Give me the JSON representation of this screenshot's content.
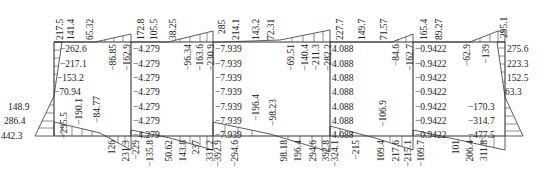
{
  "diagram": {
    "type": "frame_bending_moment",
    "frame": {
      "columns_x": [
        54,
        131,
        213,
        330,
        413,
        505
      ],
      "top_beam_y": 42,
      "bottom_beam_y": 136
    },
    "top_beam_labels": [
      {
        "text": "217.5",
        "x": 60,
        "y": 40,
        "rot": true
      },
      {
        "text": "141.4",
        "x": 71,
        "y": 40,
        "rot": true
      },
      {
        "text": "65.32",
        "x": 90,
        "y": 40,
        "rot": true
      },
      {
        "text": "172.8",
        "x": 141,
        "y": 40,
        "rot": true
      },
      {
        "text": "105.5",
        "x": 154,
        "y": 40,
        "rot": true
      },
      {
        "text": "38.25",
        "x": 173,
        "y": 40,
        "rot": true
      },
      {
        "text": "285",
        "x": 222,
        "y": 34,
        "rot": true
      },
      {
        "text": "214.1",
        "x": 236,
        "y": 40,
        "rot": true
      },
      {
        "text": "143.2",
        "x": 256,
        "y": 40,
        "rot": true
      },
      {
        "text": "72.31",
        "x": 271,
        "y": 40,
        "rot": true
      },
      {
        "text": "227.7",
        "x": 340,
        "y": 40,
        "rot": true
      },
      {
        "text": "149.7",
        "x": 362,
        "y": 40,
        "rot": true
      },
      {
        "text": "71.57",
        "x": 384,
        "y": 40,
        "rot": true
      },
      {
        "text": "165.4",
        "x": 424,
        "y": 40,
        "rot": true
      },
      {
        "text": "89.27",
        "x": 439,
        "y": 40,
        "rot": true
      },
      {
        "text": "295.1",
        "x": 504,
        "y": 38,
        "rot": true
      }
    ],
    "top_beam_neg_labels": [
      {
        "text": "−86.85",
        "x": 113,
        "y": 44
      },
      {
        "text": "−162.9",
        "x": 127,
        "y": 44
      },
      {
        "text": "−96.34",
        "x": 188,
        "y": 44
      },
      {
        "text": "−163.6",
        "x": 200,
        "y": 44
      },
      {
        "text": "−230.9",
        "x": 211,
        "y": 44
      },
      {
        "text": "−69.51",
        "x": 291,
        "y": 44
      },
      {
        "text": "−140.4",
        "x": 305,
        "y": 44
      },
      {
        "text": "−211.3",
        "x": 316,
        "y": 44
      },
      {
        "text": "−282.2",
        "x": 328,
        "y": 44
      },
      {
        "text": "−84.6",
        "x": 396,
        "y": 44
      },
      {
        "text": "−162.7",
        "x": 410,
        "y": 44
      },
      {
        "text": "−62.9",
        "x": 467,
        "y": 44
      },
      {
        "text": "−139",
        "x": 486,
        "y": 44
      }
    ],
    "column_labels": [
      {
        "text": "−262.6",
        "x": 60,
        "y": 49
      },
      {
        "text": "−217.1",
        "x": 60,
        "y": 64
      },
      {
        "text": "−153.2",
        "x": 57,
        "y": 78
      },
      {
        "text": "−70.94",
        "x": 54,
        "y": 92
      },
      {
        "text": "148.9",
        "x": 8,
        "y": 107
      },
      {
        "text": "286.4",
        "x": 4,
        "y": 121
      },
      {
        "text": "442.3",
        "x": 1,
        "y": 136
      },
      {
        "text": "−4.279",
        "x": 133,
        "y": 49
      },
      {
        "text": "−4.279",
        "x": 133,
        "y": 64
      },
      {
        "text": "−4.279",
        "x": 133,
        "y": 78
      },
      {
        "text": "−4.279",
        "x": 133,
        "y": 92
      },
      {
        "text": "−4.279",
        "x": 133,
        "y": 107
      },
      {
        "text": "−4.279",
        "x": 133,
        "y": 121
      },
      {
        "text": "−4.279",
        "x": 133,
        "y": 135
      },
      {
        "text": "−7.939",
        "x": 215,
        "y": 49
      },
      {
        "text": "−7.939",
        "x": 215,
        "y": 64
      },
      {
        "text": "−7.939",
        "x": 215,
        "y": 78
      },
      {
        "text": "−7.939",
        "x": 215,
        "y": 92
      },
      {
        "text": "−7.939",
        "x": 215,
        "y": 107
      },
      {
        "text": "−7.939",
        "x": 215,
        "y": 121
      },
      {
        "text": "−7.939",
        "x": 215,
        "y": 135
      },
      {
        "text": "4.088",
        "x": 332,
        "y": 49
      },
      {
        "text": "4.088",
        "x": 332,
        "y": 64
      },
      {
        "text": "4.088",
        "x": 332,
        "y": 78
      },
      {
        "text": "4.088",
        "x": 332,
        "y": 92
      },
      {
        "text": "4.088",
        "x": 332,
        "y": 107
      },
      {
        "text": "4.088",
        "x": 332,
        "y": 121
      },
      {
        "text": "4.088",
        "x": 332,
        "y": 135
      },
      {
        "text": "−0.9422",
        "x": 415,
        "y": 49
      },
      {
        "text": "−0.9422",
        "x": 415,
        "y": 64
      },
      {
        "text": "−0.9422",
        "x": 415,
        "y": 78
      },
      {
        "text": "−0.9422",
        "x": 415,
        "y": 92
      },
      {
        "text": "−0.9422",
        "x": 415,
        "y": 107
      },
      {
        "text": "−0.9422",
        "x": 415,
        "y": 121
      },
      {
        "text": "−0.9422",
        "x": 415,
        "y": 135
      },
      {
        "text": "275.6",
        "x": 507,
        "y": 49
      },
      {
        "text": "223.3",
        "x": 507,
        "y": 64
      },
      {
        "text": "152.5",
        "x": 507,
        "y": 78
      },
      {
        "text": "63.3",
        "x": 505,
        "y": 92
      },
      {
        "text": "−170.3",
        "x": 468,
        "y": 107
      },
      {
        "text": "−314.7",
        "x": 468,
        "y": 121
      },
      {
        "text": "−477.5",
        "x": 468,
        "y": 135
      }
    ],
    "bottom_beam_upper_labels": [
      {
        "text": "−295.5",
        "x": 64,
        "y": 112,
        "rot": true
      },
      {
        "text": "−190.1",
        "x": 79,
        "y": 98,
        "rot": true
      },
      {
        "text": "−84.77",
        "x": 97,
        "y": 96,
        "rot": true
      },
      {
        "text": "−196.4",
        "x": 256,
        "y": 94,
        "rot": true
      },
      {
        "text": "−98.23",
        "x": 273,
        "y": 99,
        "rot": true
      },
      {
        "text": "−106.9",
        "x": 383,
        "y": 100,
        "rot": true
      }
    ],
    "bottom_beam_lower_labels": [
      {
        "text": "126",
        "x": 112,
        "y": 140,
        "rot": true
      },
      {
        "text": "231.3",
        "x": 126,
        "y": 140,
        "rot": true
      },
      {
        "text": "−229",
        "x": 136,
        "y": 140,
        "rot": true
      },
      {
        "text": "−135.8",
        "x": 150,
        "y": 140,
        "rot": true
      },
      {
        "text": "50.62",
        "x": 169,
        "y": 140,
        "rot": true
      },
      {
        "text": "143.8",
        "x": 183,
        "y": 140,
        "rot": true
      },
      {
        "text": "237",
        "x": 196,
        "y": 140,
        "rot": true
      },
      {
        "text": "331.2",
        "x": 210,
        "y": 140,
        "rot": true
      },
      {
        "text": "−392.9",
        "x": 218,
        "y": 140,
        "rot": true
      },
      {
        "text": "−294.6",
        "x": 235,
        "y": 140,
        "rot": true
      },
      {
        "text": "98.18",
        "x": 284,
        "y": 140,
        "rot": true
      },
      {
        "text": "196.4",
        "x": 298,
        "y": 140,
        "rot": true
      },
      {
        "text": "294.6",
        "x": 313,
        "y": 140,
        "rot": true
      },
      {
        "text": "392.8",
        "x": 326,
        "y": 140,
        "rot": true
      },
      {
        "text": "−324.1",
        "x": 335,
        "y": 140,
        "rot": true
      },
      {
        "text": "−215",
        "x": 356,
        "y": 140,
        "rot": true
      },
      {
        "text": "109.4",
        "x": 381,
        "y": 140,
        "rot": true
      },
      {
        "text": "217.6",
        "x": 396,
        "y": 140,
        "rot": true
      },
      {
        "text": "−215.1",
        "x": 408,
        "y": 140,
        "rot": true
      },
      {
        "text": "−109.7",
        "x": 421,
        "y": 140,
        "rot": true
      },
      {
        "text": "101",
        "x": 456,
        "y": 140,
        "rot": true
      },
      {
        "text": "206.4",
        "x": 470,
        "y": 140,
        "rot": true
      },
      {
        "text": "311.8",
        "x": 484,
        "y": 140,
        "rot": true
      }
    ]
  }
}
